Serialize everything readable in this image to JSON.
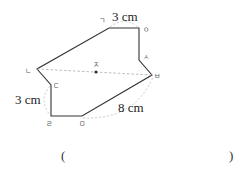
{
  "figure": {
    "type": "point-symmetric polygon",
    "vertices": [
      {
        "id": "giyeok",
        "label": "ㄱ",
        "x": 109,
        "y": 28
      },
      {
        "id": "ieung",
        "label": "ㅇ",
        "x": 139,
        "y": 28
      },
      {
        "id": "siot",
        "label": "ㅅ",
        "x": 139,
        "y": 60
      },
      {
        "id": "bieup",
        "label": "ㅂ",
        "x": 152,
        "y": 75
      },
      {
        "id": "mieum",
        "label": "ㅁ",
        "x": 82,
        "y": 116
      },
      {
        "id": "rieul",
        "label": "ㄹ",
        "x": 51,
        "y": 116
      },
      {
        "id": "digeut",
        "label": "ㄷ",
        "x": 51,
        "y": 85
      },
      {
        "id": "nieun",
        "label": "ㄴ",
        "x": 37,
        "y": 69
      }
    ],
    "center": {
      "label": "ㅈ"
    },
    "measurements": {
      "top_edge": "3 cm",
      "left_edge": "3 cm",
      "bottom_right_edge": "8 cm"
    },
    "colors": {
      "edge": "#333333",
      "dashed": "#aaaaaa",
      "label": "#555555"
    }
  },
  "answer": {
    "open_paren": "(",
    "close_paren": ")",
    "value": ""
  }
}
